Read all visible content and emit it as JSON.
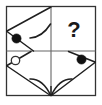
{
  "figure": {
    "type": "2x2-matrix",
    "frame": {
      "x": 6,
      "y": 6,
      "width": 90,
      "height": 90,
      "stroke_color": "#333333",
      "background_color": "#ffffff",
      "stroke_width": 1.2
    },
    "grid": {
      "rows": 2,
      "columns": 2,
      "divider_x": 51,
      "divider_y": 51,
      "divider_color": "#555555"
    },
    "cells": [
      {
        "position": "top-left",
        "label": "Cell 1",
        "contents": "left-pointing chevron with curved arc and one filled dot"
      },
      {
        "position": "top-right",
        "label": "Cell 2",
        "contents": "question mark placeholder"
      },
      {
        "position": "bottom-left",
        "label": "Cell 3",
        "contents": "hollow circle with diagonal line"
      },
      {
        "position": "bottom-right",
        "label": "Cell 4",
        "contents": "diagonal line with filled dot and curved arc"
      }
    ],
    "question_mark": {
      "glyph": "?",
      "x": 74,
      "y": 36,
      "font_size": 22,
      "color": "#1a1a1a"
    },
    "dots": [
      {
        "name": "filled-dot-top-left",
        "style": "filled",
        "cx": 16.5,
        "cy": 38.5,
        "r": 4.6,
        "fill": "#111111",
        "stroke": "#111111"
      },
      {
        "name": "hollow-dot-bottom-left",
        "style": "hollow",
        "cx": 15.5,
        "cy": 60.5,
        "r": 4.2,
        "fill": "#ffffff",
        "stroke": "#333333"
      },
      {
        "name": "filled-dot-bottom-right",
        "style": "filled",
        "cx": 81.5,
        "cy": 59.5,
        "r": 4.6,
        "fill": "#111111",
        "stroke": "#111111"
      }
    ],
    "strokes": {
      "top_left_upper_edge": "M 7 31 L 51 7",
      "top_left_lower_edge": "M 7 31 L 33 51",
      "top_left_arc": "M 31 37 Q 43 36 51 24",
      "bottom_left_diag_upper": "M 7 65 L 31 51",
      "bottom_left_diag_lower": "M 7 66 L 51 96",
      "bottom_left_arc": "M 31 79 Q 43 78 51 95",
      "bottom_right_diag_upper": "M 95 62 L 69 51",
      "bottom_right_diag_lower": "M 95 62 L 51 96",
      "bottom_right_arc": "M 71 79 Q 59 78 51 95"
    },
    "colors": {
      "ink": "#333333",
      "accent": "#111111",
      "paper": "#ffffff"
    }
  }
}
